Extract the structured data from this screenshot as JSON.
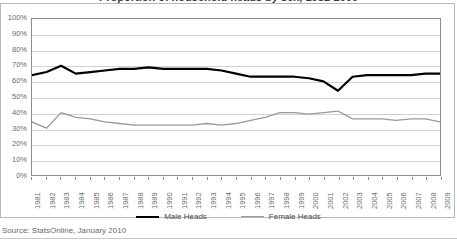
{
  "chart_title": "Proportion of household heads by sex, 1981-2009",
  "source_note": "Source: StatsOnline, January 2010",
  "legend": {
    "position": "bottom",
    "items": [
      {
        "label": "Male Heads",
        "color": "#000000",
        "key": "male"
      },
      {
        "label": "Female Heads",
        "color": "#999999",
        "key": "female"
      }
    ]
  },
  "axes": {
    "y_labels": [
      "100%",
      "90%",
      "80%",
      "70%",
      "60%",
      "50%",
      "40%",
      "30%",
      "20%",
      "10%",
      "0%"
    ],
    "x_labels": [
      "1981",
      "1982",
      "1983",
      "1984",
      "1985",
      "1986",
      "1987",
      "1988",
      "1989",
      "1990",
      "1991",
      "1992",
      "1993",
      "1994",
      "1995",
      "1996",
      "1997",
      "1998",
      "1999",
      "2000",
      "2001",
      "2002",
      "2003",
      "2004",
      "2005",
      "2006",
      "2007",
      "2008",
      "2009"
    ]
  },
  "chart_data": {
    "type": "line",
    "title": "Proportion of household heads by sex, 1981-2009",
    "xlabel": "",
    "ylabel": "",
    "ylim": [
      0,
      100
    ],
    "ytick_step": 10,
    "ytick_format": "percent",
    "grid": true,
    "legend_position": "bottom",
    "categories": [
      "1981",
      "1982",
      "1983",
      "1984",
      "1985",
      "1986",
      "1987",
      "1988",
      "1989",
      "1990",
      "1991",
      "1992",
      "1993",
      "1994",
      "1995",
      "1996",
      "1997",
      "1998",
      "1999",
      "2000",
      "2001",
      "2002",
      "2003",
      "2004",
      "2005",
      "2006",
      "2007",
      "2008",
      "2009"
    ],
    "series": [
      {
        "name": "Male Heads",
        "color": "#000000",
        "values": [
          64,
          66,
          70,
          65,
          66,
          67,
          68,
          68,
          69,
          68,
          68,
          68,
          68,
          67,
          65,
          63,
          63,
          63,
          63,
          62,
          60,
          54,
          63,
          64,
          64,
          64,
          64,
          65,
          65
        ]
      },
      {
        "name": "Female Heads",
        "color": "#999999",
        "values": [
          34,
          30,
          40,
          37,
          36,
          34,
          33,
          32,
          32,
          32,
          32,
          32,
          33,
          32,
          33,
          35,
          37,
          40,
          40,
          39,
          40,
          41,
          36,
          36,
          36,
          35,
          36,
          36,
          34
        ]
      }
    ]
  }
}
